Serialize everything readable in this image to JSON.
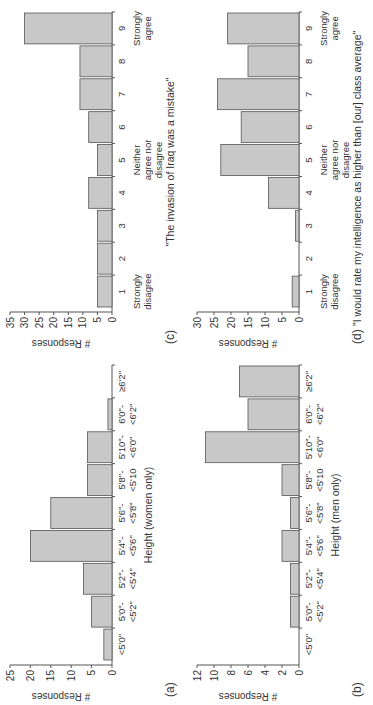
{
  "figure": {
    "panels": [
      {
        "id": "a",
        "label": "(a)",
        "title": "",
        "xlabel": "Height (women only)"
      },
      {
        "id": "b",
        "label": "(b)",
        "title": "",
        "xlabel": "Height (men only)"
      },
      {
        "id": "c",
        "label": "(c)",
        "title": "\"The invasion of Iraq was a mistake\"",
        "xlabel": ""
      },
      {
        "id": "d",
        "label": "(d)",
        "title": "\"I would rate my intelligence as higher than [our] class average\"",
        "xlabel": ""
      }
    ]
  },
  "chart_data": [
    {
      "type": "bar",
      "panel": "(a)",
      "title": "",
      "xlabel": "Height (women only)",
      "ylabel": "# Responses",
      "ylim": [
        0,
        25
      ],
      "yticks": [
        0,
        5,
        10,
        15,
        20,
        25
      ],
      "categories": [
        "<5'0\"",
        "5'0\"- <5'2\"",
        "5'2\"- <5'4\"",
        "5'4\"- <5'6\"",
        "5'6\"- <5'8\"",
        "5'8\"- <5'10",
        "5'10\"- <6'0\"",
        "6'0\"- <6'2\"",
        "≥6'2\""
      ],
      "values": [
        2,
        5,
        7,
        20,
        15,
        6,
        6,
        1,
        0
      ],
      "grid": false
    },
    {
      "type": "bar",
      "panel": "(b)",
      "title": "",
      "xlabel": "Height (men only)",
      "ylabel": "# Responses",
      "ylim": [
        0,
        12
      ],
      "yticks": [
        0,
        2,
        4,
        6,
        8,
        10,
        12
      ],
      "categories": [
        "<5'0\"",
        "5'0\"- <5'2\"",
        "5'2\"- <5'4\"",
        "5'4\"- <5'6\"",
        "5'6\"- <5'8\"",
        "5'8\"- <5'10",
        "5'10\"- <6'0\"",
        "6'0\"- <6'2\"",
        "≥6'2\""
      ],
      "values": [
        0,
        1,
        1,
        2,
        1,
        2,
        11,
        6,
        7
      ],
      "grid": false
    },
    {
      "type": "bar",
      "panel": "(c)",
      "title": "\"The invasion of Iraq was a mistake\"",
      "xlabel": "",
      "ylabel": "# Responses",
      "ylim": [
        0,
        35
      ],
      "yticks": [
        0,
        5,
        10,
        15,
        20,
        25,
        30,
        35
      ],
      "categories": [
        "1",
        "2",
        "3",
        "4",
        "5",
        "6",
        "7",
        "8",
        "9"
      ],
      "annotations": {
        "1": "Strongly disagree",
        "5": "Neither agree nor disagree",
        "9": "Strongly agree"
      },
      "values": [
        5,
        5,
        5,
        8,
        5,
        8,
        11,
        11,
        30
      ],
      "grid": false
    },
    {
      "type": "bar",
      "panel": "(d)",
      "title": "\"I would rate my intelligence as higher than [our] class average\"",
      "xlabel": "",
      "ylabel": "# Responses",
      "ylim": [
        0,
        30
      ],
      "yticks": [
        0,
        5,
        10,
        15,
        20,
        25,
        30
      ],
      "categories": [
        "1",
        "2",
        "3",
        "4",
        "5",
        "6",
        "7",
        "8",
        "9"
      ],
      "annotations": {
        "1": "Strongly disagree",
        "5": "Neither agree nor disagree",
        "9": "Strongly agree"
      },
      "values": [
        2,
        0,
        1,
        9,
        23,
        17,
        24,
        15,
        21
      ],
      "grid": false
    }
  ]
}
